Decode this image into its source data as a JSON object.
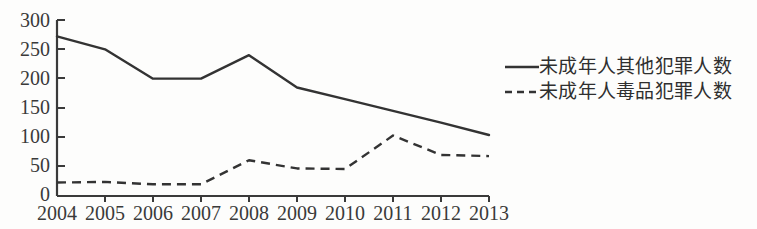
{
  "chart_data": {
    "type": "line",
    "title": "",
    "subtitle": "",
    "xlabel": "",
    "ylabel": "",
    "categories": [
      "2004",
      "2005",
      "2006",
      "2007",
      "2008",
      "2009",
      "2010",
      "2011",
      "2012",
      "2013"
    ],
    "xlim": [
      "2004",
      "2013"
    ],
    "ylim": [
      0,
      300
    ],
    "ytick_values": [
      0,
      50,
      100,
      150,
      200,
      250,
      300
    ],
    "ytick_labels": [
      "0",
      "50",
      "100",
      "150",
      "200",
      "250",
      "300"
    ],
    "grid": false,
    "legend_position": "right",
    "series": [
      {
        "name": "未成年人其他犯罪人数",
        "style": "solid",
        "color": "#333333",
        "values": [
          272,
          250,
          200,
          200,
          240,
          185,
          165,
          145,
          125,
          104
        ]
      },
      {
        "name": "未成年人毒品犯罪人数",
        "style": "dashed",
        "color": "#333333",
        "values": [
          23,
          24,
          20,
          20,
          61,
          47,
          46,
          103,
          70,
          68
        ]
      }
    ]
  },
  "legend": {
    "items": [
      {
        "label": "未成年人其他犯罪人数",
        "style": "solid"
      },
      {
        "label": "未成年人毒品犯罪人数",
        "style": "dashed"
      }
    ]
  },
  "axis": {
    "y_labels": [
      "300",
      "250",
      "200",
      "150",
      "100",
      "50",
      "0"
    ],
    "x_labels": [
      "2004",
      "2005",
      "2006",
      "2007",
      "2008",
      "2009",
      "2010",
      "2011",
      "2012",
      "2013"
    ]
  }
}
